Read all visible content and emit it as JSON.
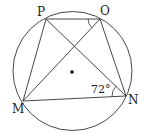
{
  "diagram": {
    "type": "geometry",
    "colors": {
      "stroke": "#333333",
      "text": "#222222",
      "background": "#ffffff"
    },
    "circle": {
      "cx": 72.5,
      "cy": 71,
      "r": 59.5
    },
    "center_dot": {
      "x": 72,
      "y": 72
    },
    "points": {
      "P": {
        "label": "P",
        "x": 46,
        "y": 19
      },
      "O": {
        "label": "O",
        "x": 100,
        "y": 19
      },
      "M": {
        "label": "M",
        "x": 23,
        "y": 101
      },
      "N": {
        "label": "N",
        "x": 126,
        "y": 96
      }
    },
    "segments": [
      "PO",
      "PM",
      "PN",
      "OM",
      "ON",
      "MN"
    ],
    "angles": [
      {
        "vertex": "N",
        "between": [
          "M",
          "P"
        ],
        "label": "72°"
      },
      {
        "vertex": "O",
        "between": [
          "P",
          "M"
        ],
        "label": ""
      }
    ]
  }
}
